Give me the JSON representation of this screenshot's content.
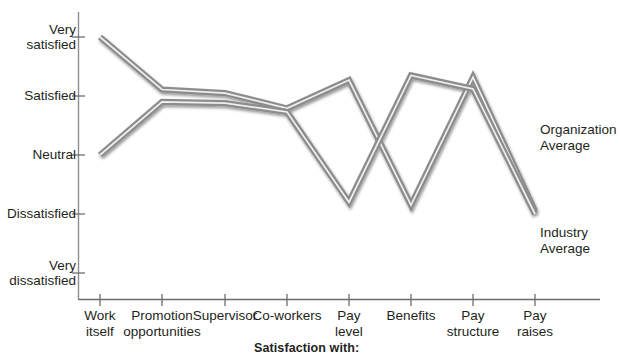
{
  "chart_data": {
    "type": "line",
    "title": "",
    "xlabel": "Satisfaction with:",
    "ylabel": "",
    "categories": [
      "Work\nitself",
      "Promotion\nopportunities",
      "Supervisor",
      "Co-workers",
      "Pay\nlevel",
      "Benefits",
      "Pay\nstructure",
      "Pay\nraises"
    ],
    "ytick_labels": [
      "Very\nsatisfied",
      "Satisfied",
      "Neutral",
      "Dissatisfied",
      "Very\ndissatisfied"
    ],
    "ytick_values": [
      5,
      4,
      3,
      2,
      1
    ],
    "ylim": [
      0.6,
      5.3
    ],
    "grid": false,
    "legend_position": "right-inline",
    "series": [
      {
        "name": "Organization\nAverage",
        "color": "#9a9a9a",
        "values": [
          5.0,
          4.11,
          4.05,
          3.79,
          4.27,
          2.15,
          4.32,
          2.05
        ]
      },
      {
        "name": "Industry\nAverage",
        "color": "#9a9a9a",
        "values": [
          3.0,
          3.9,
          3.88,
          3.73,
          2.2,
          4.35,
          4.12,
          2.0
        ]
      }
    ]
  },
  "axis_caption": "Satisfaction with:"
}
